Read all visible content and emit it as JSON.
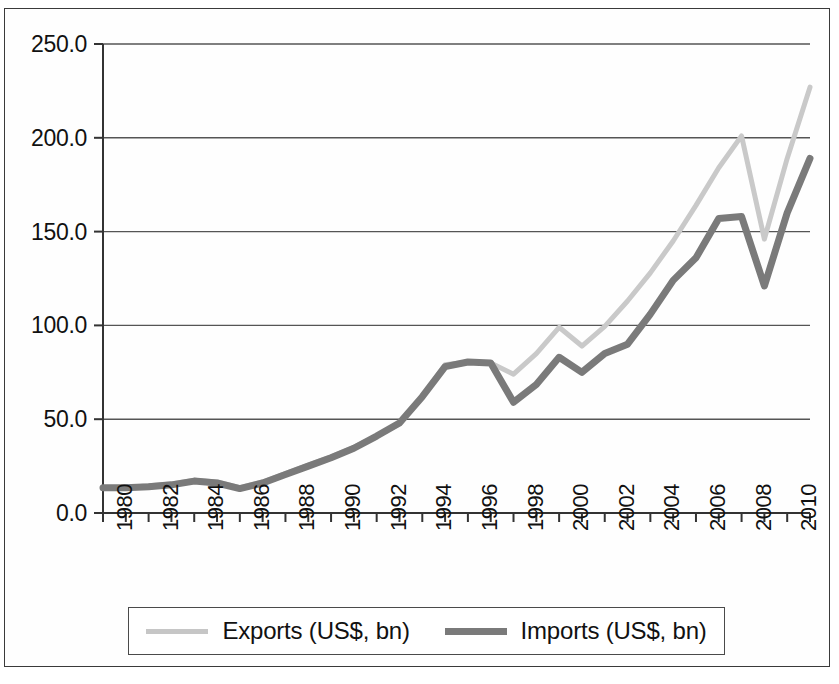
{
  "chart_data": {
    "type": "line",
    "title": "",
    "xlabel": "",
    "ylabel": "",
    "ylim": [
      0,
      250
    ],
    "ytick_labels": [
      "0.0",
      "50.0",
      "100.0",
      "150.0",
      "200.0",
      "250.0"
    ],
    "yticks": [
      0,
      50,
      100,
      150,
      200,
      250
    ],
    "grid": true,
    "grid_axis": "y",
    "legend_position": "bottom",
    "x": [
      1980,
      1981,
      1982,
      1983,
      1984,
      1985,
      1986,
      1987,
      1988,
      1989,
      1990,
      1991,
      1992,
      1993,
      1994,
      1995,
      1996,
      1997,
      1998,
      1999,
      2000,
      2001,
      2002,
      2003,
      2004,
      2005,
      2006,
      2007,
      2008,
      2009,
      2010,
      2011
    ],
    "xtick_labels": [
      "1980",
      "",
      "1982",
      "",
      "1984",
      "",
      "1986",
      "",
      "1988",
      "",
      "1990",
      "",
      "1992",
      "",
      "1994",
      "",
      "1996",
      "",
      "1998",
      "",
      "2000",
      "",
      "2002",
      "",
      "2004",
      "",
      "2006",
      "",
      "2008",
      "",
      "2010",
      ""
    ],
    "xlim": [
      1980,
      2011
    ],
    "series": [
      {
        "name": "Exports (US$, bn)",
        "color": "#c9c9c9",
        "width": 5,
        "values": [
          13.0,
          13.5,
          14.5,
          15.5,
          17.5,
          16.5,
          13.5,
          16.5,
          21.0,
          25.5,
          30.0,
          35.0,
          41.0,
          47.5,
          62.0,
          79.0,
          80.5,
          80.0,
          74.0,
          85.0,
          99.0,
          89.0,
          99.5,
          113.0,
          128.0,
          145.0,
          164.0,
          184.0,
          201.0,
          146.0,
          189.0,
          227.0
        ]
      },
      {
        "name": "Imports (US$, bn)",
        "color": "#7a7a7a",
        "width": 7,
        "values": [
          13.5,
          13.5,
          14.0,
          15.0,
          17.0,
          16.0,
          13.0,
          16.0,
          20.5,
          25.0,
          29.5,
          34.5,
          41.0,
          48.0,
          62.0,
          78.0,
          80.5,
          80.0,
          59.0,
          68.5,
          83.0,
          75.0,
          85.0,
          90.0,
          106.0,
          124.0,
          136.0,
          157.0,
          158.0,
          121.0,
          160.0,
          189.0
        ]
      }
    ]
  },
  "legend": {
    "entries": [
      {
        "label": "Exports (US$, bn)",
        "swatch": "exports"
      },
      {
        "label": "Imports (US$, bn)",
        "swatch": "imports"
      }
    ]
  }
}
